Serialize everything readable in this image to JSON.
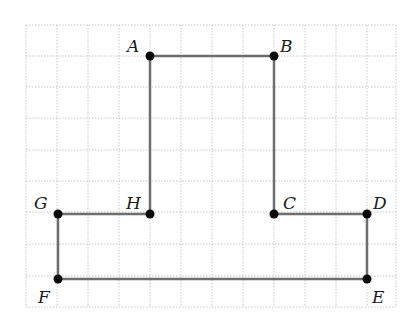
{
  "diagram": {
    "type": "grid-polygon",
    "grid": {
      "x_lines": [
        26,
        57,
        88,
        119,
        150,
        181,
        212,
        243,
        274,
        305,
        336,
        367,
        396
      ],
      "y_lines": [
        25,
        56,
        87,
        118,
        150,
        181,
        212,
        244,
        276,
        307
      ],
      "x_min": 26,
      "x_max": 396,
      "y_min": 25,
      "y_max": 307
    },
    "points": [
      {
        "label": "A",
        "x": 150,
        "y": 56,
        "lx": 127,
        "ly": 52
      },
      {
        "label": "B",
        "x": 274,
        "y": 56,
        "lx": 280,
        "ly": 52
      },
      {
        "label": "C",
        "x": 274,
        "y": 214,
        "lx": 283,
        "ly": 209
      },
      {
        "label": "D",
        "x": 367,
        "y": 214,
        "lx": 373,
        "ly": 209
      },
      {
        "label": "E",
        "x": 367,
        "y": 279,
        "lx": 372,
        "ly": 303
      },
      {
        "label": "F",
        "x": 58,
        "y": 279,
        "lx": 38,
        "ly": 303
      },
      {
        "label": "G",
        "x": 58,
        "y": 214,
        "lx": 34,
        "ly": 209
      },
      {
        "label": "H",
        "x": 150,
        "y": 214,
        "lx": 126,
        "ly": 209
      }
    ],
    "polygon_order": [
      "A",
      "B",
      "C",
      "D",
      "E",
      "F",
      "G",
      "H"
    ],
    "colors": {
      "edge": "#6e6e6e",
      "vertex": "#0a0a0a",
      "grid": "#c8c8c8"
    }
  }
}
